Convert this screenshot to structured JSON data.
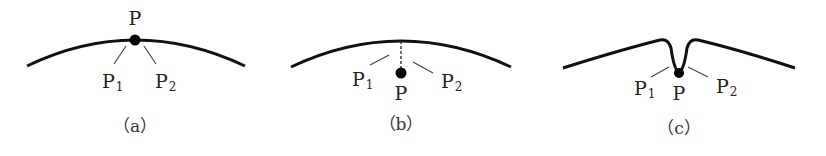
{
  "figure": {
    "panels": [
      {
        "id": "a",
        "caption": "（a）",
        "point_label": "P",
        "p1_main": "P",
        "p1_sub": "1",
        "p2_main": "P",
        "p2_sub": "2"
      },
      {
        "id": "b",
        "caption": "（b）",
        "point_label": "P",
        "p1_main": "P",
        "p1_sub": "1",
        "p2_main": "P",
        "p2_sub": "2"
      },
      {
        "id": "c",
        "caption": "（c）",
        "point_label": "P",
        "p1_main": "P",
        "p1_sub": "1",
        "p2_main": "P",
        "p2_sub": "2"
      }
    ],
    "colors": {
      "curve": "#111111",
      "leader": "#444444",
      "point": "#000000"
    }
  }
}
